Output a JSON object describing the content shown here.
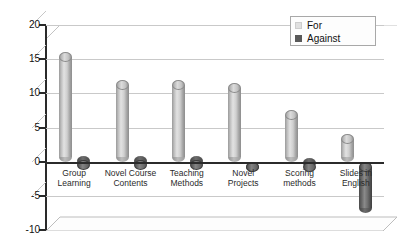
{
  "chart_data": {
    "type": "bar",
    "title": "",
    "subtitle": "",
    "xlabel": "",
    "ylabel": "",
    "ylim": [
      -10,
      20
    ],
    "ytick_labels": [
      "20",
      "15",
      "10",
      "5",
      "0",
      "-5",
      "-10"
    ],
    "ytick_values": [
      20,
      15,
      10,
      5,
      0,
      -5,
      -10
    ],
    "grid": true,
    "legend_position": "top-right",
    "style": "3d-cylinder",
    "categories": [
      "Group\nLearning",
      "Novel Course\nContents",
      "Teaching\nMethods",
      "Novel\nProjects",
      "Scoring\nmethods",
      "Slides in\nEnglish"
    ],
    "series": [
      {
        "name": "For",
        "color": "#d6d6d6",
        "values": [
          16,
          12,
          12,
          11.5,
          7.5,
          4
        ]
      },
      {
        "name": "Against",
        "color": "#595959",
        "values": [
          0.2,
          0.2,
          0.2,
          -1.5,
          -0.8,
          -7.5
        ]
      }
    ]
  },
  "legend": {
    "items": [
      {
        "label": "For",
        "swatch": "for"
      },
      {
        "label": "Against",
        "swatch": "against"
      }
    ]
  },
  "axis": {
    "y_labels": [
      "20",
      "15",
      "10",
      "5",
      "0",
      "-5",
      "-10"
    ]
  }
}
